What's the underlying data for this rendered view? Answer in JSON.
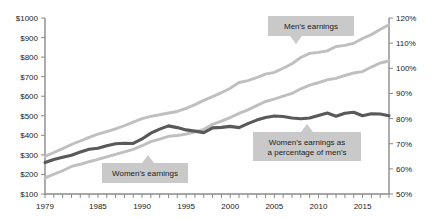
{
  "chart_data": {
    "type": "line",
    "title": "",
    "subtitle": "",
    "xlabel": "",
    "ylabel": "",
    "grid": false,
    "legend_position": "inline-callouts",
    "x_axis": {
      "range": [
        1979,
        2018
      ],
      "tick_labels": [
        "1979",
        "1985",
        "1990",
        "1995",
        "2000",
        "2005",
        "2010",
        "2015"
      ],
      "tick_values": [
        1979,
        1985,
        1990,
        1995,
        2000,
        2005,
        2010,
        2015
      ],
      "minor_ticks_every": 1
    },
    "y_axis_left": {
      "range": [
        100,
        1000
      ],
      "tick_labels": [
        "$100",
        "$200",
        "$300",
        "$400",
        "$500",
        "$600",
        "$700",
        "$800",
        "$900",
        "$1000"
      ],
      "tick_values": [
        100,
        200,
        300,
        400,
        500,
        600,
        700,
        800,
        900,
        1000
      ]
    },
    "y_axis_right": {
      "range": [
        50,
        120
      ],
      "tick_labels": [
        "50%",
        "60%",
        "70%",
        "80%",
        "90%",
        "100%",
        "110%",
        "120%"
      ],
      "tick_values": [
        50,
        60,
        70,
        80,
        90,
        100,
        110,
        120
      ]
    },
    "x": [
      1979,
      1980,
      1981,
      1982,
      1983,
      1984,
      1985,
      1986,
      1987,
      1988,
      1989,
      1990,
      1991,
      1992,
      1993,
      1994,
      1995,
      1996,
      1997,
      1998,
      1999,
      2000,
      2001,
      2002,
      2003,
      2004,
      2005,
      2006,
      2007,
      2008,
      2009,
      2010,
      2011,
      2012,
      2013,
      2014,
      2015,
      2016,
      2017,
      2018
    ],
    "series": [
      {
        "name": "Men's earnings",
        "axis": "left",
        "unit": "$",
        "color": "#bfbfbf",
        "values": [
          292,
          312,
          332,
          353,
          371,
          390,
          406,
          419,
          433,
          449,
          468,
          485,
          497,
          505,
          514,
          522,
          538,
          557,
          579,
          598,
          618,
          641,
          670,
          680,
          695,
          713,
          722,
          743,
          766,
          798,
          819,
          824,
          832,
          854,
          860,
          871,
          895,
          915,
          941,
          965
        ]
      },
      {
        "name": "Women's earnings",
        "axis": "left",
        "unit": "$",
        "color": "#bfbfbf",
        "values": [
          182,
          201,
          219,
          241,
          252,
          265,
          277,
          290,
          303,
          315,
          328,
          347,
          368,
          381,
          395,
          399,
          406,
          418,
          431,
          456,
          473,
          491,
          512,
          530,
          552,
          573,
          585,
          600,
          614,
          638,
          657,
          669,
          684,
          691,
          706,
          719,
          726,
          749,
          770,
          780
        ]
      },
      {
        "name": "Women's earnings as a percentage of men's",
        "axis": "right",
        "unit": "%",
        "color": "#595959",
        "values": [
          62.5,
          63.7,
          64.6,
          65.4,
          66.7,
          67.8,
          68.2,
          69.2,
          70.0,
          70.2,
          70.1,
          71.9,
          74.2,
          75.8,
          77.1,
          76.4,
          75.5,
          75.0,
          74.4,
          76.3,
          76.5,
          76.9,
          76.4,
          78.0,
          79.4,
          80.4,
          81.0,
          80.8,
          80.2,
          79.9,
          80.2,
          81.2,
          82.2,
          80.9,
          82.1,
          82.5,
          81.1,
          81.9,
          81.8,
          81.1
        ]
      }
    ],
    "annotations": [
      {
        "label": "Men's earnings",
        "lines": [
          "Men's earnings"
        ],
        "box": {
          "x": 268,
          "y": 16,
          "width": 86,
          "height": 20
        },
        "pointer": {
          "x": 296,
          "y": 36,
          "direction": "down"
        },
        "background": "#c9c9c9",
        "text_color": "#1c1c1c"
      },
      {
        "label": "Women's earnings",
        "lines": [
          "Women's earnings"
        ],
        "box": {
          "x": 102,
          "y": 163,
          "width": 86,
          "height": 20
        },
        "pointer": {
          "x": 148,
          "y": 163,
          "direction": "up"
        },
        "background": "#c9c9c9",
        "text_color": "#1c1c1c"
      },
      {
        "label": "Women's earnings as a percentage of men's",
        "lines": [
          "Women's earnings as",
          "a percentage of men's"
        ],
        "box": {
          "x": 253,
          "y": 132,
          "width": 108,
          "height": 29
        },
        "pointer": {
          "x": 307,
          "y": 132,
          "direction": "up"
        },
        "background": "#c9c9c9",
        "text_color": "#1c1c1c"
      }
    ],
    "colors": {
      "light_line": "#bfbfbf",
      "dark_line": "#595959",
      "axis": "#8a8a8a",
      "callout_bg": "#c9c9c9",
      "text": "#1a1a1a",
      "background": "#ffffff"
    }
  }
}
